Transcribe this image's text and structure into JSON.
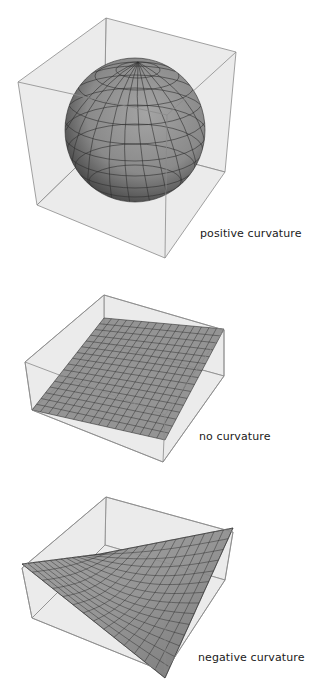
{
  "figures": [
    {
      "id": "sphere",
      "label": "positive curvature",
      "label_pos": [
        200,
        227
      ]
    },
    {
      "id": "plane",
      "label": "no curvature",
      "label_pos": [
        199,
        430
      ]
    },
    {
      "id": "saddle",
      "label": "negative curvature",
      "label_pos": [
        198,
        651
      ]
    }
  ],
  "colors": {
    "box_face": "#e6e6e6",
    "box_edge": "#8a8a8a",
    "surface": "#8c8c8c",
    "mesh": "#333333",
    "text": "#1a1a1a"
  }
}
